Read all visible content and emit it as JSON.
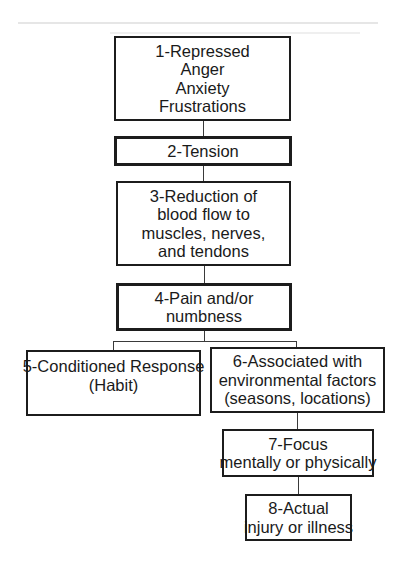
{
  "diagram": {
    "type": "flowchart",
    "nodes": [
      {
        "id": 1,
        "lines": [
          "1-Repressed",
          "Anger",
          "Anxiety",
          "Frustrations"
        ]
      },
      {
        "id": 2,
        "lines": [
          "2-Tension"
        ]
      },
      {
        "id": 3,
        "lines": [
          "3-Reduction of",
          "blood flow to",
          "muscles, nerves,",
          "and tendons"
        ]
      },
      {
        "id": 4,
        "lines": [
          "4-Pain and/or",
          "numbness"
        ]
      },
      {
        "id": 5,
        "lines": [
          "5-Conditioned Response",
          "(Habit)"
        ]
      },
      {
        "id": 6,
        "lines": [
          "6-Associated with",
          "environmental factors",
          "(seasons, locations)"
        ]
      },
      {
        "id": 7,
        "lines": [
          "7-Focus",
          "mentally or physically"
        ]
      },
      {
        "id": 8,
        "lines": [
          "8-Actual",
          "injury or illness"
        ]
      }
    ],
    "edges": [
      {
        "from": 1,
        "to": 2
      },
      {
        "from": 2,
        "to": 3
      },
      {
        "from": 3,
        "to": 4
      },
      {
        "from": 4,
        "to": 5
      },
      {
        "from": 4,
        "to": 6
      },
      {
        "from": 6,
        "to": 7
      },
      {
        "from": 7,
        "to": 8
      }
    ],
    "colors": {
      "border": "#1c1c1c",
      "text": "#1a1a1a",
      "connector": "#3a3a3a",
      "background": "#ffffff"
    }
  }
}
